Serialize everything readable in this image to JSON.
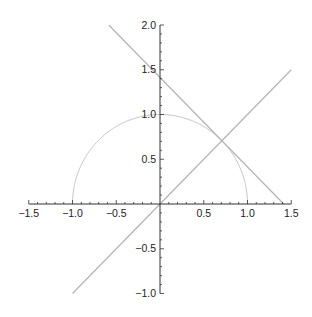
{
  "chart_data": {
    "type": "line",
    "title": "",
    "xlabel": "",
    "ylabel": "",
    "xlim": [
      -1.5,
      1.5
    ],
    "ylim": [
      -1.0,
      2.0
    ],
    "grid": false,
    "axes_origin": [
      0,
      0
    ],
    "x_ticks": [
      "-1.5",
      "-1.0",
      "-0.5",
      "0.5",
      "1.0",
      "1.5"
    ],
    "y_ticks": [
      "-1.0",
      "-0.5",
      "0.5",
      "1.0",
      "1.5",
      "2.0"
    ],
    "series": [
      {
        "name": "upper unit semicircle",
        "equation": "y = sqrt(1 - x^2)",
        "x_range": [
          -1,
          1
        ],
        "color": "#c8c8c8"
      },
      {
        "name": "line y = x",
        "equation": "y = x",
        "x_range": [
          -1,
          1.5
        ],
        "color": "#b4b4b4"
      },
      {
        "name": "tangent line",
        "equation": "y = -x + 1.414",
        "x_range": [
          -0.586,
          1.414
        ],
        "color": "#b4b4b4"
      }
    ]
  }
}
